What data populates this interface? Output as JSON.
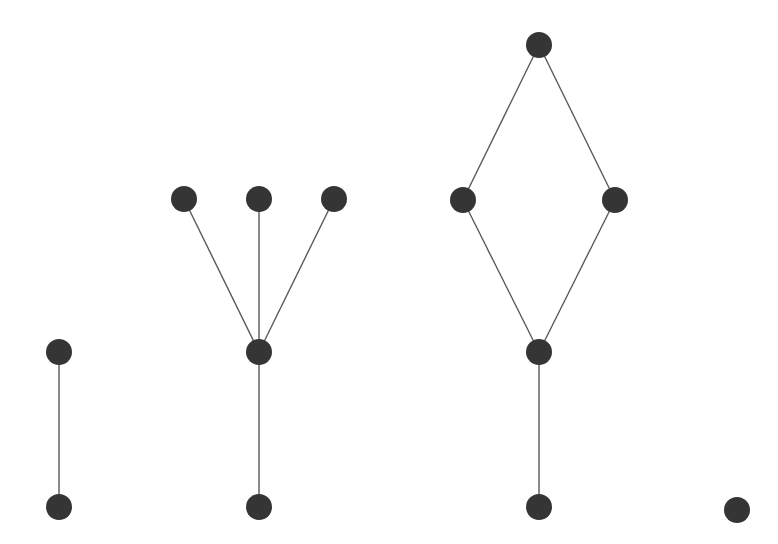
{
  "diagram": {
    "type": "graph-components",
    "background": "#ffffff",
    "node_color": "#353535",
    "edge_color": "#5a5a5a",
    "node_radius": 13,
    "nodes": [
      {
        "id": "a1",
        "x": 59,
        "y": 352
      },
      {
        "id": "a2",
        "x": 59,
        "y": 507
      },
      {
        "id": "b1",
        "x": 184,
        "y": 199
      },
      {
        "id": "b2",
        "x": 259,
        "y": 199
      },
      {
        "id": "b3",
        "x": 334,
        "y": 199
      },
      {
        "id": "b4",
        "x": 259,
        "y": 352
      },
      {
        "id": "b5",
        "x": 259,
        "y": 507
      },
      {
        "id": "c1",
        "x": 539,
        "y": 45
      },
      {
        "id": "c2",
        "x": 463,
        "y": 200
      },
      {
        "id": "c3",
        "x": 615,
        "y": 200
      },
      {
        "id": "c4",
        "x": 539,
        "y": 352
      },
      {
        "id": "c5",
        "x": 539,
        "y": 507
      },
      {
        "id": "d1",
        "x": 737,
        "y": 510
      }
    ],
    "edges": [
      [
        "a1",
        "a2"
      ],
      [
        "b1",
        "b4"
      ],
      [
        "b2",
        "b4"
      ],
      [
        "b3",
        "b4"
      ],
      [
        "b4",
        "b5"
      ],
      [
        "c1",
        "c2"
      ],
      [
        "c1",
        "c3"
      ],
      [
        "c2",
        "c4"
      ],
      [
        "c3",
        "c4"
      ],
      [
        "c4",
        "c5"
      ]
    ]
  }
}
